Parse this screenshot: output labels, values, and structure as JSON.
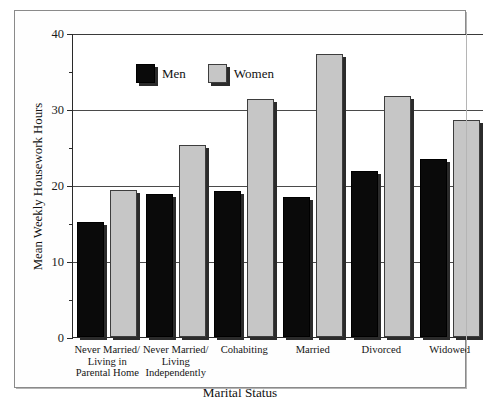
{
  "chart_data": {
    "type": "bar",
    "title": "",
    "xlabel": "Marital Status",
    "ylabel": "Mean Weekly Housework Hours",
    "categories": [
      "Never Married/\nLiving in\nParental Home",
      "Never Married/\nLiving\nIndependently",
      "Cohabiting",
      "Married",
      "Divorced",
      "Widowed"
    ],
    "series": [
      {
        "name": "Men",
        "color": "#0a0a0a",
        "values": [
          15.1,
          18.8,
          19.2,
          18.4,
          21.8,
          23.4
        ]
      },
      {
        "name": "Women",
        "color": "#c6c6c6",
        "values": [
          19.3,
          25.2,
          31.3,
          37.3,
          31.7,
          28.5
        ]
      }
    ],
    "ylim": [
      0,
      40
    ],
    "yticks": [
      0,
      10,
      20,
      30,
      40
    ],
    "ytick_labels": [
      "0",
      "10",
      "20",
      "30",
      "40"
    ],
    "yminor_ticks": [
      5,
      15,
      25,
      35
    ],
    "gridlines": [
      10,
      20,
      30,
      40
    ],
    "grid": true,
    "legend_position": "top-left"
  },
  "legend": {
    "items": [
      {
        "label": "Men"
      },
      {
        "label": "Women"
      }
    ]
  }
}
